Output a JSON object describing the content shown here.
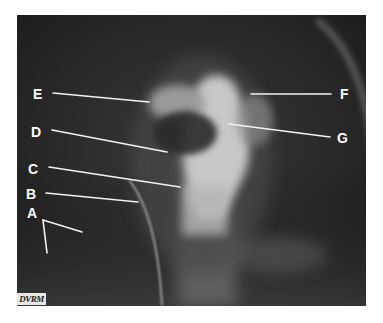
{
  "figure": {
    "type": "radiograph",
    "labels": [
      {
        "id": "A",
        "text": "A"
      },
      {
        "id": "B",
        "text": "B"
      },
      {
        "id": "C",
        "text": "C"
      },
      {
        "id": "D",
        "text": "D"
      },
      {
        "id": "E",
        "text": "E"
      },
      {
        "id": "F",
        "text": "F"
      },
      {
        "id": "G",
        "text": "G"
      }
    ],
    "watermark": "DVRM",
    "colors": {
      "background": "#2a2a2a",
      "annotation": "#ffffff",
      "page": "#ffffff"
    }
  }
}
